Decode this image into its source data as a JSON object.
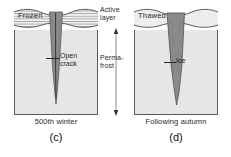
{
  "figure": {
    "type": "cross-section-diagram",
    "background_color": "#ffffff"
  },
  "center": {
    "active_layer_label": "Active\nlayer",
    "permafrost_label": "Perma-\nfrost"
  },
  "panels": [
    {
      "id": "c",
      "caption": "(c)",
      "sub_caption": "500th winter",
      "surface_tag": "Frozen",
      "active_layer_texture": "horizontal-hatch",
      "wedge_label": "Open\ncrack",
      "wedge_fill": "#8f8f8f",
      "body_fill": "#e6e6e4"
    },
    {
      "id": "d",
      "caption": "(d)",
      "sub_caption": "Following autumn",
      "surface_tag": "Thawed",
      "active_layer_texture": "stipple",
      "wedge_label": "Ice",
      "wedge_fill": "#8a8a8a",
      "body_fill": "#e6e6e4"
    }
  ],
  "colors": {
    "outline": "#5a5a5a",
    "text": "#1f1f1f",
    "permafrost": "#e6e6e4",
    "wedge": "#8f8f8f",
    "active_layer": "#f2f2f0"
  }
}
